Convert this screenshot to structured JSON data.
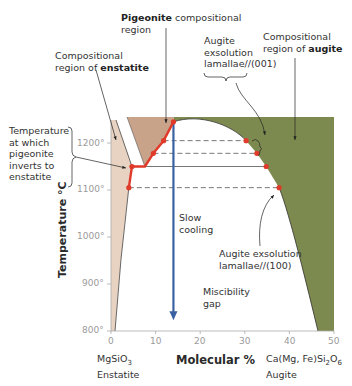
{
  "chart_data": {
    "type": "phase-diagram",
    "title": "",
    "xlabel": "Molecular %",
    "ylabel": "Temperature °C",
    "xlim": [
      0,
      50
    ],
    "ylim": [
      800,
      1250
    ],
    "x_ticks": [
      "0",
      "10",
      "20",
      "30",
      "40",
      "50"
    ],
    "y_ticks": [
      "800°",
      "900°",
      "1000°",
      "1100°",
      "1200°"
    ],
    "x_endmembers": {
      "left": {
        "formula": "MgSiO3",
        "formula_main": "MgSiO",
        "formula_sub": "3",
        "name": "Enstatite"
      },
      "right": {
        "formula": "Ca(Mg, Fe)Si2O6",
        "formula_parts": [
          "Ca(Mg, Fe)Si",
          "2",
          "O",
          "6"
        ],
        "name": "Augite"
      }
    },
    "regions": [
      {
        "name": "enstatite",
        "color": "#e8d3c2"
      },
      {
        "name": "pigeonite",
        "color": "#c9a28a"
      },
      {
        "name": "augite",
        "color": "#7d8a4f"
      },
      {
        "name": "miscibility gap",
        "color": "#ffffff"
      }
    ],
    "cooling_path": {
      "x": 14,
      "from_T": 1245,
      "to_T": 825,
      "color": "#3a62a3"
    },
    "pigeonite_path": [
      [
        14,
        1245
      ],
      [
        11.8,
        1205
      ],
      [
        9.5,
        1178
      ],
      [
        7.6,
        1150
      ],
      [
        4.7,
        1150
      ],
      [
        4,
        1105
      ]
    ],
    "augite_points": [
      [
        30.3,
        1205
      ],
      [
        32.7,
        1178
      ],
      [
        34.8,
        1150
      ],
      [
        37.7,
        1105
      ]
    ],
    "tie_lines": [
      {
        "T": 1205,
        "from": 11.8,
        "to": 30.3,
        "style": "dashed"
      },
      {
        "T": 1178,
        "from": 9.5,
        "to": 32.7,
        "style": "dashed"
      },
      {
        "T": 1150,
        "from": 7.6,
        "to": 34.8,
        "style": "solid"
      },
      {
        "T": 1105,
        "from": 4,
        "to": 37.7,
        "style": "dashed"
      }
    ],
    "path_color": "#e03a2a",
    "annotations": [
      {
        "id": "pigeonite",
        "bold": "Pigeonite",
        "text": " compositional region"
      },
      {
        "id": "enstatite",
        "text": "Compositional region of ",
        "bold": "enstatite"
      },
      {
        "id": "augite-region",
        "text": "Compositional region of ",
        "bold": "augite"
      },
      {
        "id": "lamellae-001",
        "text": "Augite exsolution lamallae//(001)"
      },
      {
        "id": "lamellae-100",
        "text": "Augite exsolution lamallae//(100)"
      },
      {
        "id": "inversion",
        "text": "Temperature at which pigeonite inverts to enstatite"
      },
      {
        "id": "slow-cooling",
        "text": "Slow cooling"
      },
      {
        "id": "miscibility",
        "text": "Miscibility gap"
      }
    ]
  },
  "labels": {
    "pig_bold": "Pigeonite",
    "pig_rest1": " compositional",
    "pig_rest2": "region",
    "ens_line1": "Compositional",
    "ens_line2a": "region of ",
    "ens_bold": "enstatite",
    "aug_line1": "Compositional",
    "aug_line2a": "region of ",
    "aug_bold": "augite",
    "lam001_1": "Augite",
    "lam001_2": "exsolution",
    "lam001_3": "lamallae//(001)",
    "lam100_1": "Augite exsolution",
    "lam100_2": "lamallae//(100)",
    "inv_1": "Temperature",
    "inv_2": "at which",
    "inv_3": "pigeonite",
    "inv_4": "inverts to",
    "inv_5": "enstatite",
    "slow_1": "Slow",
    "slow_2": "cooling",
    "mis_1": "Miscibility",
    "mis_2": "gap"
  }
}
